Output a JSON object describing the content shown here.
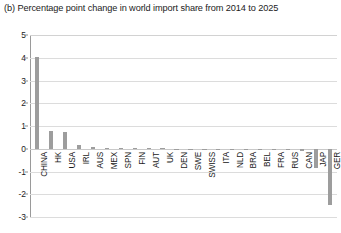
{
  "chart_data": {
    "type": "bar",
    "title": "(b) Percentage point change in world import share from 2014 to 2025",
    "xlabel": "",
    "ylabel": "",
    "ylim": [
      -3,
      5
    ],
    "yticks": [
      5,
      4,
      3,
      2,
      1,
      0,
      -1,
      -2,
      -3
    ],
    "ytick_labels": [
      "5",
      "4",
      "3",
      "2",
      "1",
      "0",
      "-1",
      "-2",
      "-3"
    ],
    "grid": true,
    "legend": "none",
    "bar_color": "#9d9d9d",
    "categories": [
      "CHINA",
      "HK",
      "USA",
      "IRL",
      "AUS",
      "MEX",
      "SPN",
      "FIN",
      "AUT",
      "UK",
      "DEN",
      "SWE",
      "SWISS",
      "ITA",
      "NLD",
      "BRA",
      "BEL",
      "FRA",
      "RUS",
      "CAN",
      "JAP",
      "GER"
    ],
    "values": [
      4.05,
      0.76,
      0.74,
      0.17,
      0.06,
      0.05,
      0.04,
      0.03,
      0.02,
      0.02,
      0.01,
      0.01,
      0.01,
      0.0,
      -0.01,
      -0.02,
      -0.03,
      -0.04,
      -0.06,
      -0.08,
      -0.86,
      -2.46
    ]
  }
}
